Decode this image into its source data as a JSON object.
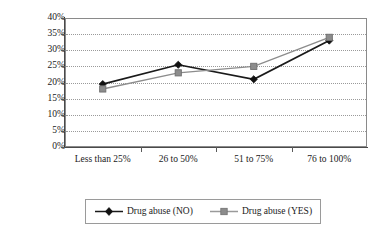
{
  "chart_data": {
    "type": "line",
    "title": "",
    "subtitle": "",
    "xlabel": "",
    "ylabel": "",
    "categories": [
      "Less than 25%",
      "26 to 50%",
      "51 to 75%",
      "76 to 100%"
    ],
    "series": [
      {
        "name": "Drug abuse (NO)",
        "values": [
          19.5,
          25.5,
          21.0,
          33.0
        ],
        "color": "#1a1a1a",
        "marker": "diamond"
      },
      {
        "name": "Drug abuse (YES)",
        "values": [
          18.0,
          23.0,
          25.0,
          34.0
        ],
        "color": "#8c8c8c",
        "marker": "square"
      }
    ],
    "ylim": [
      0,
      40
    ],
    "ytick_step": 5,
    "ytick_labels": [
      "0%",
      "5%",
      "10%",
      "15%",
      "20%",
      "25%",
      "30%",
      "35%",
      "40%"
    ],
    "grid": true,
    "grid_axis": "y",
    "grid_style": "dotted",
    "legend_position": "bottom",
    "axis_color": "#4a4a4a",
    "grid_color": "#9a9a9a",
    "background": "#ffffff"
  },
  "legend": {
    "entries": [
      {
        "label": "Drug abuse (NO)"
      },
      {
        "label": "Drug abuse (YES)"
      }
    ]
  }
}
